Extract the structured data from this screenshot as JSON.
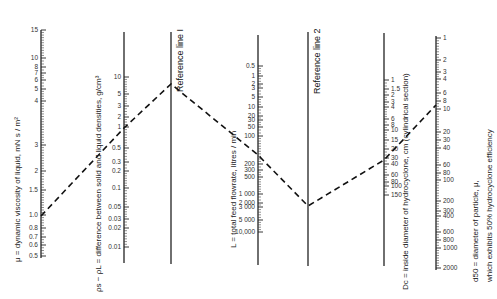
{
  "chart_data": {
    "type": "nomograph",
    "axes": [
      {
        "id": "mu",
        "title": "μ = dynamic viscosity of liquid,   mN s / m²",
        "x": 41,
        "y_top": 30,
        "y_bottom": 258,
        "ticks": [
          {
            "v": "15",
            "y": 30
          },
          {
            "v": "10",
            "y": 58
          },
          {
            "v": "8",
            "y": 67
          },
          {
            "v": "7",
            "y": 73
          },
          {
            "v": "6",
            "y": 80
          },
          {
            "v": "5",
            "y": 89
          },
          {
            "v": "4",
            "y": 101
          },
          {
            "v": "3",
            "y": 145
          },
          {
            "v": "2",
            "y": 171
          },
          {
            "v": "1.5",
            "y": 190
          },
          {
            "v": "1.0",
            "y": 215
          },
          {
            "v": "0.8",
            "y": 228
          },
          {
            "v": "0.7",
            "y": 237
          },
          {
            "v": "0.6",
            "y": 245
          },
          {
            "v": "0.5",
            "y": 256
          }
        ]
      },
      {
        "id": "density_diff",
        "title": "ρs − ρL = difference between solid and liquid densities,  g/cm³",
        "x": 124,
        "y_top": 32,
        "y_bottom": 263,
        "ticks": [
          {
            "v": "10",
            "y": 77
          },
          {
            "v": "5",
            "y": 94
          },
          {
            "v": "3",
            "y": 106
          },
          {
            "v": "2",
            "y": 117
          },
          {
            "v": "1",
            "y": 127
          },
          {
            "v": "0.5",
            "y": 148
          },
          {
            "v": "0.3",
            "y": 162
          },
          {
            "v": "0.2",
            "y": 171
          },
          {
            "v": "0.1",
            "y": 188
          },
          {
            "v": "0.05",
            "y": 207
          },
          {
            "v": "0.03",
            "y": 219
          },
          {
            "v": "0.02",
            "y": 228
          },
          {
            "v": "0.01",
            "y": 247
          }
        ]
      },
      {
        "id": "ref1",
        "title": "Reference line I",
        "x": 171,
        "y_top": 32,
        "y_bottom": 264,
        "ticks": []
      },
      {
        "id": "flowrate",
        "title": "L = total feed flowrate,  litres / min",
        "x": 258,
        "y_top": 35,
        "y_bottom": 265,
        "ticks": [
          {
            "v": "0.5",
            "y": 66
          },
          {
            "v": "1",
            "y": 76
          },
          {
            "v": "2",
            "y": 84
          },
          {
            "v": "3",
            "y": 88
          },
          {
            "v": "5",
            "y": 97
          },
          {
            "v": "10",
            "y": 107
          },
          {
            "v": "20",
            "y": 116
          },
          {
            "v": "30",
            "y": 120
          },
          {
            "v": "50",
            "y": 127
          },
          {
            "v": "100",
            "y": 136
          },
          {
            "v": "200",
            "y": 164
          },
          {
            "v": "300",
            "y": 170
          },
          {
            "v": "500",
            "y": 177
          },
          {
            "v": "1 000",
            "y": 194
          },
          {
            "v": "2 000",
            "y": 203
          },
          {
            "v": "3 000",
            "y": 207
          },
          {
            "v": "5 000",
            "y": 220
          },
          {
            "v": "10,000",
            "y": 232
          }
        ]
      },
      {
        "id": "ref2",
        "title": "Reference line 2",
        "x": 308,
        "y_top": 32,
        "y_bottom": 266,
        "ticks": []
      },
      {
        "id": "dc",
        "title": "Dc = inside diameter of hydrocyclone,   cm  (cylindrical section)",
        "x": 384,
        "y_top": 33,
        "y_bottom": 266,
        "ticks": [
          {
            "v": "1",
            "y": 80
          },
          {
            "v": "1.5",
            "y": 89
          },
          {
            "v": "2",
            "y": 95
          },
          {
            "v": "3",
            "y": 102
          },
          {
            "v": "4",
            "y": 107
          },
          {
            "v": "6",
            "y": 119
          },
          {
            "v": "8",
            "y": 125
          },
          {
            "v": "10",
            "y": 130
          },
          {
            "v": "15",
            "y": 140
          },
          {
            "v": "20",
            "y": 149
          },
          {
            "v": "30",
            "y": 158
          },
          {
            "v": "40",
            "y": 164
          },
          {
            "v": "60",
            "y": 175
          },
          {
            "v": "80",
            "y": 182
          },
          {
            "v": "100",
            "y": 186
          },
          {
            "v": "150",
            "y": 195
          }
        ]
      },
      {
        "id": "d50",
        "title": "d50 = diameter of particle,  μ,",
        "title2": "which exhibits 50% hydrocyclone efficiency",
        "x": 436,
        "y_top": 36,
        "y_bottom": 270,
        "ticks": [
          {
            "v": "1",
            "y": 38
          },
          {
            "v": "2",
            "y": 60
          },
          {
            "v": "3",
            "y": 72
          },
          {
            "v": "4",
            "y": 79
          },
          {
            "v": "6",
            "y": 93
          },
          {
            "v": "8",
            "y": 101
          },
          {
            "v": "10",
            "y": 109
          },
          {
            "v": "20",
            "y": 132
          },
          {
            "v": "30",
            "y": 140
          },
          {
            "v": "40",
            "y": 148
          },
          {
            "v": "60",
            "y": 165
          },
          {
            "v": "80",
            "y": 173
          },
          {
            "v": "100",
            "y": 180
          },
          {
            "v": "200",
            "y": 201
          },
          {
            "v": "300",
            "y": 211
          },
          {
            "v": "400",
            "y": 216
          },
          {
            "v": "600",
            "y": 232
          },
          {
            "v": "800",
            "y": 240
          },
          {
            "v": "1000",
            "y": 248
          },
          {
            "v": "2000",
            "y": 268
          }
        ]
      }
    ],
    "example_path": {
      "style": "dashed",
      "points": [
        [
          41,
          216
        ],
        [
          124,
          128
        ],
        [
          171,
          84
        ],
        [
          258,
          155
        ],
        [
          308,
          206
        ],
        [
          384,
          160
        ],
        [
          436,
          105
        ]
      ],
      "readings": {
        "mu": "1.0",
        "density_diff": "1",
        "flowrate": "~150",
        "dc": "~17",
        "d50": "~12"
      }
    }
  },
  "labels": {
    "mu": "μ = dynamic viscosity of liquid,   mN s / m²",
    "density": "ρs − ρL = difference between solid and liquid densities,  g/cm³",
    "ref1": "Reference line I",
    "flow": "L = total feed flowrate,  litres / min",
    "ref2": "Reference line 2",
    "dc": "Dc = inside diameter of hydrocyclone,   cm  (cylindrical section)",
    "d50a": "d50 = diameter of particle,  μ,",
    "d50b": "which exhibits 50% hydrocyclone efficiency"
  }
}
